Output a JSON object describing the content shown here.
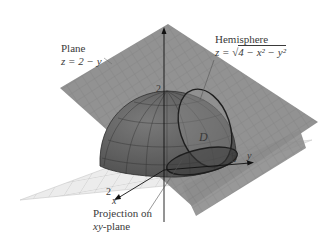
{
  "figure": {
    "plane_label": {
      "title": "Plane",
      "equation": "z = 2 − y"
    },
    "hemisphere_label": {
      "title": "Hemisphere",
      "equation_prefix": "z = ",
      "radicand": "4 − x² − y²"
    },
    "region_label": "D",
    "projection_label": {
      "line1": "Projection on",
      "line2_italic": "xy",
      "line2_rest": "-plane"
    },
    "axes": {
      "z_tick": "2",
      "y_tick": "2",
      "y_axis": "y",
      "x_tick": "2",
      "x_axis": "x"
    },
    "colors": {
      "plane": "#8a8a8a",
      "plane_dark": "#6f6f6f",
      "hemisphere": "#5c5c5c",
      "xy_plane": "#e8e8e8",
      "grid": "#9a9a9a",
      "text": "#3a3a3a"
    }
  }
}
